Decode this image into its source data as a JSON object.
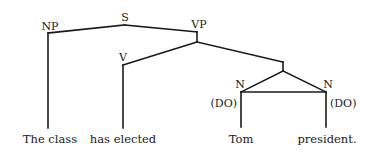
{
  "diagram": {
    "type": "syntax-tree",
    "nodes": {
      "s": "S",
      "np": "NP",
      "vp": "VP",
      "v": "V",
      "n_left": "N",
      "n_right": "N",
      "do_left": "(DO)",
      "do_right": "(DO)"
    },
    "words": {
      "np_word": "The class",
      "v_word": "has elected",
      "n_left_word": "Tom",
      "n_right_word": "president."
    },
    "colors": {
      "line": "#1a1a1a",
      "background": "#ffffff"
    }
  }
}
